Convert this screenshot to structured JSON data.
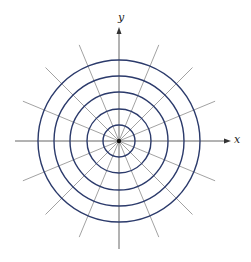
{
  "diagram": {
    "type": "polar-grid",
    "center": [
      119,
      141
    ],
    "circle_radii": [
      16,
      32,
      49,
      65,
      81
    ],
    "radial_line_count": 16,
    "radial_angle_step_deg": 22.5,
    "radial_line_length": 104,
    "colors": {
      "circles": "#2b3a6b",
      "radials": "#8a8a8a",
      "axes": "#555555",
      "origin": "#111111"
    },
    "axes": {
      "x_label": "x",
      "y_label": "y"
    }
  }
}
